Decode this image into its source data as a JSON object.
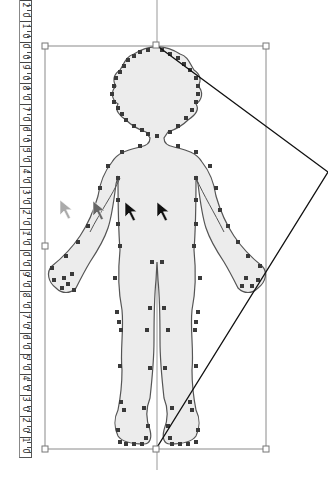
{
  "ruler": {
    "orientation": "vertical",
    "labels": [
      "2",
      "0",
      "1",
      "0",
      "0",
      "0",
      "9",
      "0",
      "8",
      "0",
      "7",
      "0",
      "6",
      "0",
      "5",
      "0",
      "4",
      "0",
      "3",
      "0",
      "2",
      "0",
      "1",
      "0",
      "0",
      "0",
      "9",
      "0",
      "8",
      "0",
      "7",
      "0",
      "6",
      "0",
      "5",
      "0",
      "4",
      "0",
      "3",
      "0",
      "2",
      "0",
      "1",
      "0"
    ]
  },
  "selection": {
    "bbox": {
      "x1": 45,
      "y1": 46,
      "x2": 266,
      "y2": 449
    },
    "center_guide_x": 157,
    "handle_color": "#ffffff",
    "frame_color": "#888888"
  },
  "skew_lines": {
    "color": "#111111",
    "points": [
      [
        156,
        45
      ],
      [
        328,
        172
      ],
      [
        156,
        449
      ]
    ]
  },
  "figure": {
    "fill": "#ececec",
    "stroke": "#555555",
    "anchor_color": "#333333"
  },
  "cursors": [
    {
      "name": "cursor-ghost-1",
      "x": 60,
      "y": 200,
      "color": "#aaaaaa"
    },
    {
      "name": "cursor-ghost-2",
      "x": 93,
      "y": 201,
      "color": "#666666"
    },
    {
      "name": "cursor-active-1",
      "x": 125,
      "y": 202,
      "color": "#111111"
    },
    {
      "name": "cursor-active-2",
      "x": 157,
      "y": 202,
      "color": "#111111"
    }
  ]
}
